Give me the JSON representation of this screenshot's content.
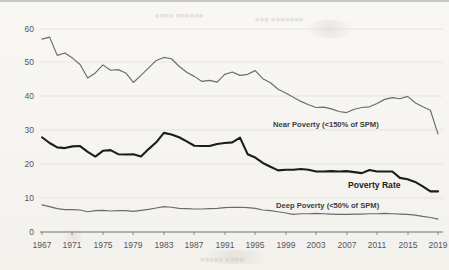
{
  "chart_data": {
    "type": "line",
    "title": "",
    "xlabel": "",
    "ylabel": "",
    "xlim": [
      1967,
      2019
    ],
    "ylim": [
      0,
      60
    ],
    "grid": true,
    "legend": "inline-annotations",
    "x": [
      1967,
      1968,
      1969,
      1970,
      1971,
      1972,
      1973,
      1974,
      1975,
      1976,
      1977,
      1978,
      1979,
      1980,
      1981,
      1982,
      1983,
      1984,
      1985,
      1986,
      1987,
      1988,
      1989,
      1990,
      1991,
      1992,
      1993,
      1994,
      1995,
      1996,
      1997,
      1998,
      1999,
      2000,
      2001,
      2002,
      2003,
      2004,
      2005,
      2006,
      2007,
      2008,
      2009,
      2010,
      2011,
      2012,
      2013,
      2014,
      2015,
      2016,
      2017,
      2018,
      2019
    ],
    "xtick_labels": [
      "1967",
      "1971",
      "1975",
      "1979",
      "1983",
      "1987",
      "1991",
      "1995",
      "1999",
      "2003",
      "2007",
      "2011",
      "2015",
      "2019"
    ],
    "ytick_labels": [
      "0",
      "10",
      "20",
      "30",
      "40",
      "50",
      "60"
    ],
    "ytick_values": [
      0,
      10,
      20,
      30,
      40,
      50,
      60
    ],
    "series": [
      {
        "name": "Near Poverty (<150% of SPM)",
        "label": "Near Poverty (<150% of SPM)",
        "style": "thin-gray",
        "color": "#6a6b6e",
        "values": [
          57.0,
          57.6,
          52.2,
          52.9,
          51.4,
          49.5,
          45.5,
          47.0,
          49.4,
          47.8,
          48.0,
          47.0,
          44.2,
          46.3,
          48.5,
          50.7,
          51.6,
          51.2,
          49.0,
          47.2,
          46.0,
          44.5,
          44.8,
          44.3,
          46.6,
          47.3,
          46.3,
          46.6,
          47.7,
          45.3,
          44.1,
          42.2,
          41.1,
          39.8,
          38.6,
          37.6,
          36.8,
          36.9,
          36.4,
          35.6,
          35.3,
          36.3,
          36.8,
          37.0,
          38.0,
          39.2,
          39.7,
          39.4,
          40.1,
          38.2,
          37.0,
          36.0,
          29.0
        ]
      },
      {
        "name": "Poverty Rate",
        "label": "Poverty Rate",
        "style": "bold-black",
        "color": "#1b1c1f",
        "values": [
          28.0,
          26.3,
          25.0,
          24.8,
          25.3,
          25.4,
          23.7,
          22.3,
          24.0,
          24.2,
          23.0,
          22.9,
          23.0,
          22.3,
          24.5,
          26.5,
          29.3,
          28.8,
          28.0,
          26.8,
          25.5,
          25.4,
          25.4,
          26.0,
          26.3,
          26.5,
          27.9,
          23.0,
          22.0,
          20.4,
          19.3,
          18.2,
          18.4,
          18.4,
          18.6,
          18.4,
          17.9,
          17.9,
          18.0,
          17.9,
          18.0,
          17.7,
          17.4,
          18.3,
          17.9,
          17.9,
          17.9,
          16.0,
          15.6,
          14.8,
          13.5,
          12.0,
          12.0
        ]
      },
      {
        "name": "Deep Poverty (<50% of SPM)",
        "label": "Deep Poverty (<50% of SPM)",
        "style": "thin-gray",
        "color": "#6a6b6e",
        "values": [
          8.0,
          7.5,
          6.9,
          6.6,
          6.6,
          6.5,
          6.0,
          6.3,
          6.4,
          6.2,
          6.3,
          6.3,
          6.1,
          6.4,
          6.7,
          7.1,
          7.5,
          7.3,
          7.0,
          6.9,
          6.8,
          6.8,
          6.9,
          7.0,
          7.2,
          7.3,
          7.3,
          7.2,
          7.0,
          6.5,
          6.3,
          6.0,
          5.6,
          5.2,
          5.4,
          5.4,
          5.5,
          5.4,
          5.3,
          5.2,
          5.2,
          5.3,
          5.3,
          5.4,
          5.4,
          5.5,
          5.4,
          5.3,
          5.2,
          5.0,
          4.6,
          4.3,
          3.8
        ]
      }
    ]
  },
  "annotations": {
    "near_poverty": "Near Poverty (<150% of SPM)",
    "poverty_rate": "Poverty Rate",
    "deep_poverty": "Deep Poverty (<50% of SPM)"
  },
  "colors": {
    "background": "#f8f7f4",
    "thin_line": "#6a6b6e",
    "bold_line": "#1b1c1f",
    "gridline": "#dedcd7",
    "axis": "#6e6f72",
    "tick_text": "#55565a"
  }
}
